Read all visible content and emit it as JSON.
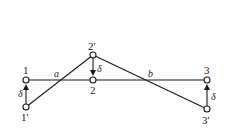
{
  "diagram": {
    "nodes": [
      {
        "id": "1",
        "label": "1",
        "x": 26,
        "y": 80
      },
      {
        "id": "1p",
        "label": "1'",
        "x": 26,
        "y": 107
      },
      {
        "id": "2",
        "label": "2",
        "x": 93,
        "y": 80
      },
      {
        "id": "2p",
        "label": "2'",
        "x": 93,
        "y": 55
      },
      {
        "id": "3",
        "label": "3",
        "x": 207,
        "y": 80
      },
      {
        "id": "3p",
        "label": "3'",
        "x": 207,
        "y": 109
      }
    ],
    "edges": [
      {
        "from": "1",
        "to": "3",
        "style": "solid"
      },
      {
        "from": "1p",
        "to": "2p",
        "style": "solid"
      },
      {
        "from": "2p",
        "to": "3p",
        "style": "solid"
      }
    ],
    "displacements": [
      {
        "from": "1p",
        "to": "1",
        "label": "δ"
      },
      {
        "from": "2p",
        "to": "2",
        "label": "δ"
      },
      {
        "from": "3p",
        "to": "3",
        "label": "δ"
      }
    ],
    "intersections": [
      {
        "label": "a",
        "x": 56,
        "y": 80
      },
      {
        "label": "b",
        "x": 150,
        "y": 80
      }
    ],
    "labels": {
      "n1": "1",
      "n1p": "1'",
      "n2": "2",
      "n2p": "2'",
      "n3": "3",
      "n3p": "3'",
      "a": "a",
      "b": "b",
      "delta1": "δ",
      "delta2": "δ",
      "delta3": "δ"
    }
  }
}
